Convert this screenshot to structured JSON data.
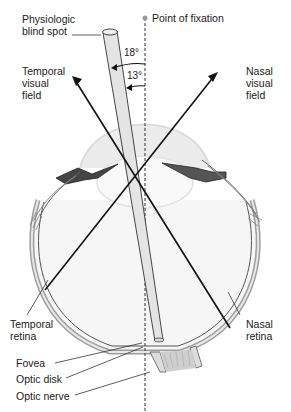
{
  "figure": {
    "labels": {
      "blind_spot": "Physiologic\nblind spot",
      "fixation": "Point of fixation",
      "temporal_field": "Temporal\nvisual\nfield",
      "nasal_field": "Nasal\nvisual\nfield",
      "temporal_retina": "Temporal\nretina",
      "nasal_retina": "Nasal\nretina",
      "fovea": "Fovea",
      "optic_disk": "Optic disk",
      "optic_nerve": "Optic nerve"
    },
    "angles": {
      "outer": "18°",
      "inner": "13°"
    },
    "colors": {
      "line": "#111111",
      "eye_fill": "#f4f4f4",
      "lens_fill": "#e6e6e6",
      "sclera": "#bdbdbd",
      "text": "#222222",
      "fixation_dot": "#9a9a9a"
    }
  }
}
